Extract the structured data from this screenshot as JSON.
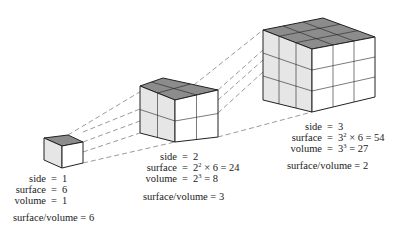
{
  "figure": {
    "cubes": [
      {
        "id": "small",
        "side": "1",
        "surface": "6",
        "volume": "1",
        "ratio_label": "surface/volume = 6",
        "colors": {
          "top": "#8c8c8c",
          "left": "#e6e6e6",
          "right": "#ffffff"
        }
      },
      {
        "id": "medium",
        "side": "2",
        "surface_base": "2",
        "surface_exp": "2",
        "surface_rest": " × 6 = 24",
        "volume_base": "2",
        "volume_exp": "3",
        "volume_rest": " = 8",
        "ratio_label": "surface/volume = 3"
      },
      {
        "id": "large",
        "side": "3",
        "surface_base": "3",
        "surface_exp": "2",
        "surface_rest": " × 6 = 54",
        "volume_base": "3",
        "volume_exp": "3",
        "volume_rest": " = 27",
        "ratio_label": "surface/volume = 2"
      }
    ],
    "labels": {
      "side": "side",
      "surface": "surface",
      "volume": "volume",
      "eq": "="
    }
  }
}
